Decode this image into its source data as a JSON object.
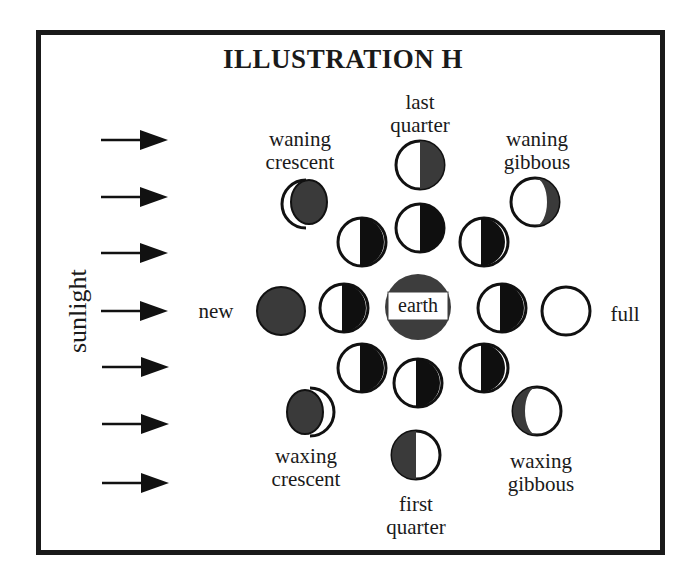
{
  "diagram": {
    "title": "ILLUSTRATION H",
    "sunlight_label": "sunlight",
    "sunlight_arrow_count": 7,
    "center": {
      "label": "earth",
      "fill": "#3d3d3d"
    },
    "colors": {
      "frame": "#1a1a1a",
      "shadow_inner": "#0f0f0f",
      "shadow_outer": "#3a3a3a",
      "lit": "#ffffff",
      "outline": "#111111"
    },
    "inner_ring": {
      "description": "Moon in orbit around Earth, left half lit by sunlight, right half in shadow",
      "count": 8
    },
    "phases": {
      "new": "new",
      "waxing_crescent": "waxing\ncrescent",
      "first_quarter": "first\nquarter",
      "waxing_gibbous": "waxing\ngibbous",
      "full": "full",
      "waning_gibbous": "waning\ngibbous",
      "last_quarter": "last\nquarter",
      "waning_crescent": "waning\ncrescent"
    }
  }
}
